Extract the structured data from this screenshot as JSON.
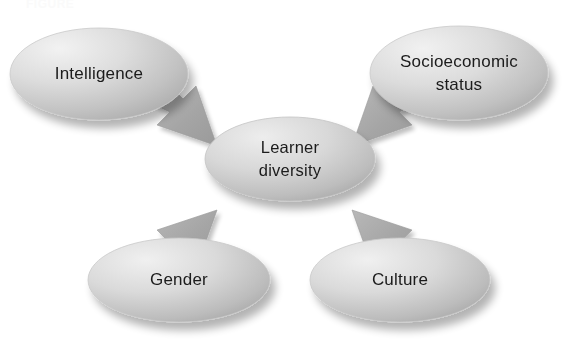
{
  "diagram": {
    "caption_ghost": "FIGURE",
    "background_color": "#ffffff",
    "center": {
      "id": "learner-diversity",
      "label_lines": [
        "Learner",
        "diversity"
      ],
      "label": "Learner diversity",
      "cx": 290,
      "cy": 159,
      "rx": 85,
      "ry": 42,
      "fill_light": "#e6e6e6",
      "fill_dark": "#b9b9b9"
    },
    "nodes": [
      {
        "id": "intelligence",
        "label_lines": [
          "Intelligence"
        ],
        "label": "Intelligence",
        "cx": 99,
        "cy": 74,
        "rx": 89,
        "ry": 46,
        "fill_light": "#e9e9e9",
        "fill_dark": "#b4b4b4",
        "position": "top-left"
      },
      {
        "id": "socioeconomic-status",
        "label_lines": [
          "Socioeconomic",
          "status"
        ],
        "label": "Socioeconomic status",
        "cx": 459,
        "cy": 73,
        "rx": 89,
        "ry": 47,
        "fill_light": "#e9e9e9",
        "fill_dark": "#b4b4b4",
        "position": "top-right"
      },
      {
        "id": "gender",
        "label_lines": [
          "Gender"
        ],
        "label": "Gender",
        "cx": 179,
        "cy": 280,
        "rx": 91,
        "ry": 42,
        "fill_light": "#ececec",
        "fill_dark": "#b0b0b0",
        "position": "bottom-left"
      },
      {
        "id": "culture",
        "label_lines": [
          "Culture"
        ],
        "label": "Culture",
        "cx": 400,
        "cy": 280,
        "rx": 90,
        "ry": 42,
        "fill_light": "#ececec",
        "fill_dark": "#b0b0b0",
        "position": "bottom-right"
      }
    ],
    "arrows": [
      {
        "id": "arrow-intelligence-to-center",
        "from": "intelligence",
        "to": "learner-diversity",
        "direction": "down-right",
        "color": "#a9a9a9"
      },
      {
        "id": "arrow-socioeconomic-to-center",
        "from": "socioeconomic-status",
        "to": "learner-diversity",
        "direction": "down-left",
        "color": "#a9a9a9"
      },
      {
        "id": "arrow-gender-to-center",
        "from": "gender",
        "to": "learner-diversity",
        "direction": "up-right",
        "color": "#a9a9a9"
      },
      {
        "id": "arrow-culture-to-center",
        "from": "culture",
        "to": "learner-diversity",
        "direction": "up-left",
        "color": "#a9a9a9"
      }
    ]
  }
}
